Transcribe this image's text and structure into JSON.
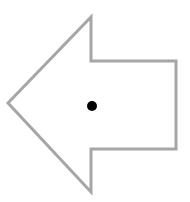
{
  "diagram": {
    "shape": "left-arrow",
    "stroke_color": "#a6a6a6",
    "fill_color": "#ffffff",
    "dot_color": "#000000",
    "arrow_points": "8,103 91,17 91,61 176,61 176,149 91,149 91,192",
    "dot": {
      "cx": 92,
      "cy": 106,
      "r": 5
    }
  }
}
